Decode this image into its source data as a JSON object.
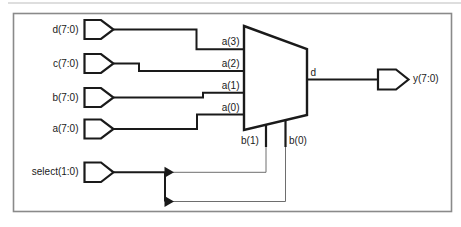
{
  "colors": {
    "line": "#1a1a1a",
    "thin_line": "#6e6e6e",
    "frame": "#8a8a8a",
    "faint_rule": "#bdbdbd",
    "background": "#ffffff"
  },
  "schematic": {
    "input_ports": [
      {
        "label": "d(7:0)"
      },
      {
        "label": "c(7:0)"
      },
      {
        "label": "b(7:0)"
      },
      {
        "label": "a(7:0)"
      },
      {
        "label": "select(1:0)"
      }
    ],
    "output_port": {
      "label": "y(7:0)"
    },
    "mux": {
      "data_pins": [
        "a(3)",
        "a(2)",
        "a(1)",
        "a(0)"
      ],
      "select_pins": [
        "b(1)",
        "b(0)"
      ],
      "output_pin": "d"
    }
  }
}
